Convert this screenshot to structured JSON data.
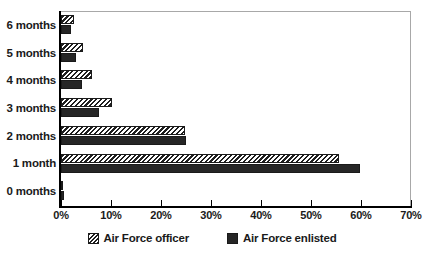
{
  "chart_data": {
    "type": "bar",
    "orientation": "horizontal",
    "title": "",
    "xlabel": "",
    "ylabel": "",
    "categories": [
      "0 months",
      "1 month",
      "2 months",
      "3 months",
      "4 months",
      "5 months",
      "6 months"
    ],
    "series": [
      {
        "name": "Air Force officer",
        "pattern": "diagonal-hatch",
        "color": "#1f1f1f",
        "values": [
          0.4,
          55.5,
          24.8,
          10.1,
          6.1,
          4.4,
          2.5
        ]
      },
      {
        "name": "Air Force enlisted",
        "pattern": "solid",
        "color": "#262626",
        "values": [
          0.5,
          59.8,
          25.0,
          7.5,
          4.2,
          3.0,
          1.9
        ]
      }
    ],
    "xlim": [
      0,
      70
    ],
    "xticks": [
      0,
      10,
      20,
      30,
      40,
      50,
      60,
      70
    ],
    "xtick_labels": [
      "0%",
      "10%",
      "20%",
      "30%",
      "40%",
      "50%",
      "60%",
      "70%"
    ],
    "grid": false,
    "legend_position": "bottom"
  },
  "legend": {
    "items": [
      {
        "label": "Air Force officer"
      },
      {
        "label": "Air Force enlisted"
      }
    ]
  }
}
